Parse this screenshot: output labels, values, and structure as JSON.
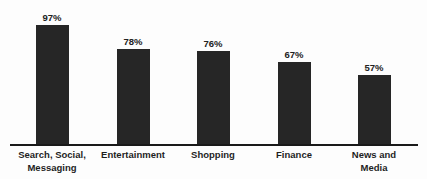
{
  "chart_data": {
    "type": "bar",
    "title": "",
    "subtitle": "",
    "xlabel": "",
    "ylabel": "",
    "ylim": [
      0,
      100
    ],
    "grid": false,
    "legend": false,
    "orientation": "vertical",
    "value_suffix": "%",
    "categories": [
      "Search, Social,\nMessaging",
      "Entertainment",
      "Shopping",
      "Finance",
      "News and\nMedia"
    ],
    "values": [
      97,
      78,
      76,
      67,
      57
    ],
    "value_labels": [
      "97%",
      "78%",
      "76%",
      "67%",
      "57%"
    ],
    "colors": {
      "bar": "#262626",
      "background": "#fdfdfd",
      "axis": "#1a1a1a",
      "label_text": "#1f1f1f",
      "value_text": "#222222"
    }
  },
  "bars": [
    {
      "label": "Search, Social,\nMessaging",
      "value": 97,
      "value_label": "97%"
    },
    {
      "label": "Entertainment",
      "value": 78,
      "value_label": "78%"
    },
    {
      "label": "Shopping",
      "value": 76,
      "value_label": "76%"
    },
    {
      "label": "Finance",
      "value": 67,
      "value_label": "67%"
    },
    {
      "label": "News and\nMedia",
      "value": 57,
      "value_label": "57%"
    }
  ]
}
